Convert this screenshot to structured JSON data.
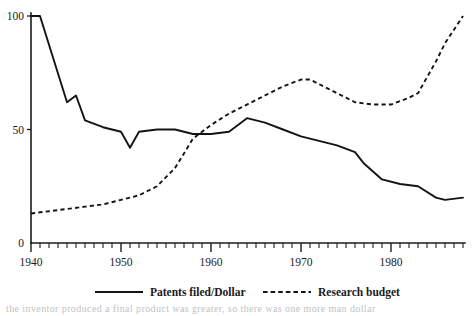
{
  "chart_data": {
    "type": "line",
    "title": "",
    "xlabel": "",
    "ylabel": "",
    "xlim": [
      1940,
      1988
    ],
    "ylim": [
      0,
      100
    ],
    "yticks": [
      0,
      50,
      100
    ],
    "xticks_major": [
      1940,
      1950,
      1960,
      1970,
      1980
    ],
    "xtick_labels": [
      "1940",
      "1950",
      "1960",
      "1970",
      "1980"
    ],
    "xtick_minor_step": 1,
    "grid": false,
    "legend_position": "bottom",
    "series": [
      {
        "name": "Patents filed/Dollar",
        "style": "solid",
        "x": [
          1940,
          1941,
          1944,
          1945,
          1946,
          1948,
          1950,
          1951,
          1952,
          1954,
          1956,
          1958,
          1960,
          1962,
          1964,
          1966,
          1968,
          1970,
          1972,
          1974,
          1976,
          1977,
          1979,
          1981,
          1983,
          1985,
          1986,
          1988
        ],
        "values": [
          100,
          100,
          62,
          65,
          54,
          51,
          49,
          42,
          49,
          50,
          50,
          48,
          48,
          49,
          55,
          53,
          50,
          47,
          45,
          43,
          40,
          35,
          28,
          26,
          25,
          20,
          19,
          20
        ]
      },
      {
        "name": "Research budget",
        "style": "dashed",
        "x": [
          1940,
          1942,
          1944,
          1946,
          1948,
          1950,
          1952,
          1954,
          1956,
          1958,
          1960,
          1962,
          1964,
          1966,
          1968,
          1970,
          1971,
          1973,
          1975,
          1976,
          1978,
          1980,
          1982,
          1983,
          1985,
          1986,
          1988
        ],
        "values": [
          13,
          14,
          15,
          16,
          17,
          19,
          21,
          25,
          33,
          46,
          52,
          57,
          61,
          65,
          69,
          72,
          72,
          68,
          64,
          62,
          61,
          61,
          64,
          66,
          80,
          88,
          100
        ]
      }
    ],
    "legend": [
      {
        "label": "Patents filed/Dollar",
        "style": "solid"
      },
      {
        "label": "Research budget",
        "style": "dashed"
      }
    ]
  },
  "caption": {
    "text": "the inventor produced a final product was greater, so there was one more man dollar"
  }
}
